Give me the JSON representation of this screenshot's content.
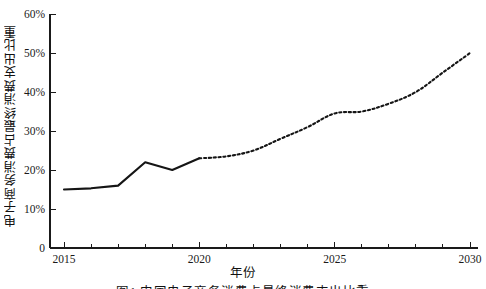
{
  "figure": {
    "xlabel": "年份",
    "ylabel": "电子商务消费占最终消费支出比重",
    "caption": "图1  中国电子商务消费占最终消费支出比重"
  },
  "axes": {
    "y_ticks": [
      "0",
      "10%",
      "20%",
      "30%",
      "40%",
      "50%",
      "60%"
    ],
    "x_ticks": [
      "2015",
      "2020",
      "2025",
      "2030"
    ]
  },
  "chart_data": {
    "type": "line",
    "title": "",
    "xlabel": "年份",
    "ylabel": "电子商务消费占最终消费支出比重",
    "xlim": [
      2015,
      2030
    ],
    "ylim": [
      0,
      60
    ],
    "grid": false,
    "legend": "none",
    "x": [
      2015,
      2016,
      2017,
      2018,
      2019,
      2020,
      2021,
      2022,
      2023,
      2024,
      2025,
      2026,
      2027,
      2028,
      2029,
      2030
    ],
    "y_tick_values": [
      0,
      10,
      20,
      30,
      40,
      50,
      60
    ],
    "y_tick_labels": [
      "0",
      "10%",
      "20%",
      "30%",
      "40%",
      "50%",
      "60%"
    ],
    "x_tick_values": [
      2015,
      2020,
      2025,
      2030
    ],
    "x_tick_labels": [
      "2015",
      "2020",
      "2025",
      "2030"
    ],
    "x_minor_tick_interval": 1,
    "series": [
      {
        "name": "历史值",
        "style": "solid",
        "color": "#151515",
        "x": [
          2015,
          2016,
          2017,
          2018,
          2019,
          2020
        ],
        "values": [
          15.0,
          15.3,
          16.0,
          22.0,
          20.0,
          23.0
        ]
      },
      {
        "name": "预测值",
        "style": "dashed",
        "color": "#151515",
        "x": [
          2020,
          2021,
          2022,
          2023,
          2024,
          2025,
          2026,
          2027,
          2028,
          2029,
          2030
        ],
        "values": [
          23.0,
          23.5,
          25.0,
          28.0,
          31.0,
          34.5,
          35.0,
          37.0,
          40.0,
          45.0,
          50.0
        ]
      }
    ]
  }
}
